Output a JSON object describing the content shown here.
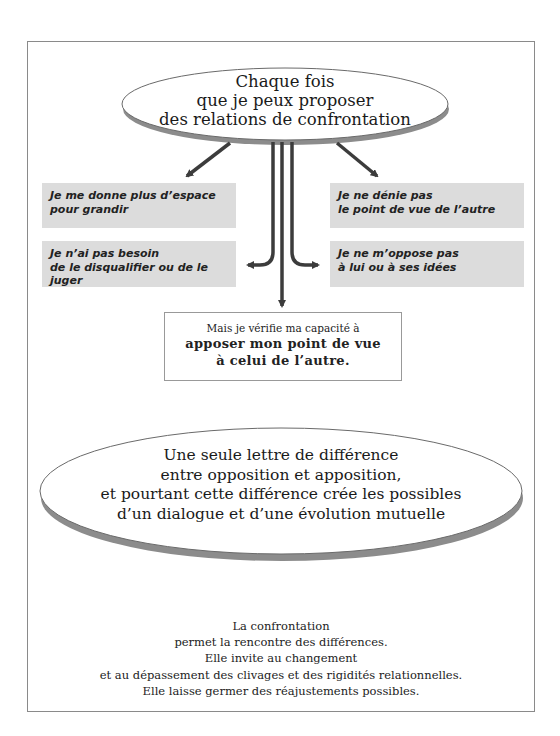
{
  "top_ellipse": {
    "lines": [
      "Chaque fois",
      "que je peux proposer",
      "des relations de confrontation"
    ]
  },
  "branches": {
    "left_top": {
      "lines": [
        "Je me donne plus d’espace",
        "pour grandir"
      ]
    },
    "left_bottom": {
      "lines": [
        "Je n’ai  pas besoin",
        "de le disqualifier ou de le juger"
      ]
    },
    "right_top": {
      "lines": [
        "Je ne dénie pas",
        "le point de vue de l’autre"
      ]
    },
    "right_bottom": {
      "lines": [
        "Je ne m’oppose pas",
        "à lui ou à ses idées"
      ]
    }
  },
  "center_box": {
    "intro": "Mais je vérifie ma capacité à",
    "emphasis": [
      "apposer mon point de vue",
      "à celui de l’autre."
    ]
  },
  "bottom_ellipse": {
    "lines": [
      "Une seule lettre de différence",
      "entre opposition et apposition,",
      "et pourtant cette différence crée les possibles",
      "d’un dialogue et d’une évolution mutuelle"
    ]
  },
  "footer": {
    "lines": [
      "La confrontation",
      "permet la rencontre des différences.",
      "Elle invite au changement",
      "et au dépassement des clivages et des rigidités relationnelles.",
      "Elle laisse germer des réajustements possibles."
    ]
  },
  "colors": {
    "box_fill": "#dcdcdc",
    "arrow": "#3c3c3c",
    "ellipse_shadow": "#8c8c8c",
    "frame": "#8a8a8a"
  }
}
